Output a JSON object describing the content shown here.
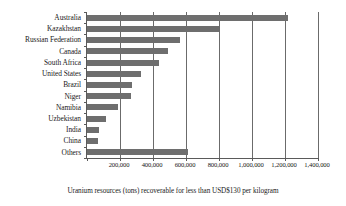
{
  "chart_data": {
    "type": "bar",
    "orientation": "horizontal",
    "title": "",
    "subtitle": "",
    "xlabel": "Uranium resources (tons) recoverable for less than USD$130 per kilogram",
    "ylabel": "",
    "categories": [
      "Australia",
      "Kazakhstan",
      "Russian Federation",
      "Canada",
      "South Africa",
      "United States",
      "Brazil",
      "Niger",
      "Namibia",
      "Uzbekistan",
      "India",
      "China",
      "Others"
    ],
    "values": [
      1220000,
      800000,
      565000,
      490000,
      435000,
      330000,
      270000,
      265000,
      190000,
      115000,
      73000,
      66000,
      615000
    ],
    "xlim": [
      0,
      1400000
    ],
    "xticks": [
      0,
      200000,
      400000,
      600000,
      800000,
      1000000,
      1200000,
      1400000
    ],
    "xticklabels": [
      "",
      "200,000",
      "400,000",
      "600,000",
      "800,000",
      "1,000,000",
      "1,200,000",
      "1,400,000"
    ],
    "grid": "vertical",
    "legend": "none",
    "bar_color": "#6e6e6e",
    "axis_color": "#5a5a5a",
    "gridline_color": "#6b6b6b",
    "background_color": "#ffffff"
  }
}
